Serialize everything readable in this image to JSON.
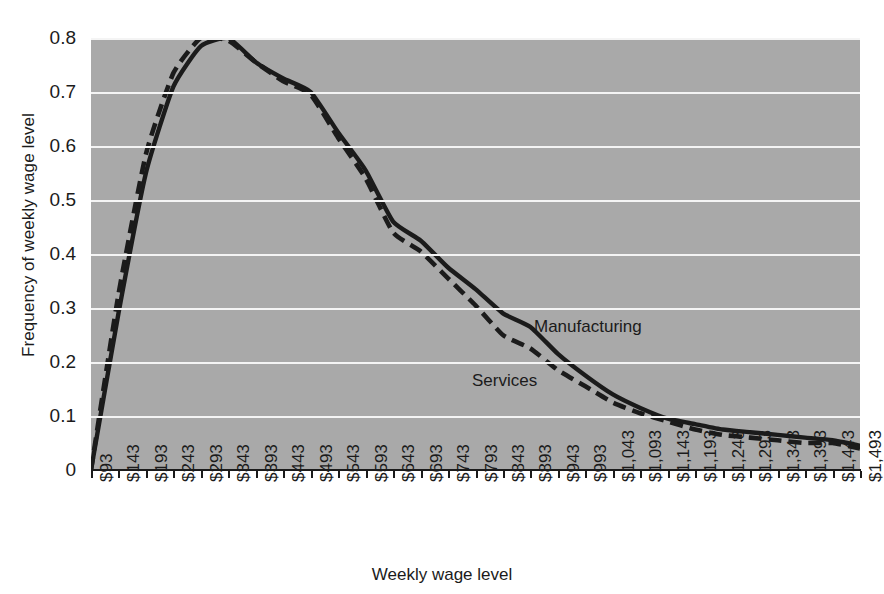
{
  "chart_data": {
    "type": "line",
    "title": "",
    "subtitle": "",
    "xlabel": "Weekly wage level",
    "ylabel": "Frequency of weekly wage level",
    "grid": true,
    "legend_position": "inline-annotations",
    "plot_background_color": "#a9a9a9",
    "gridline_color": "#f4f4f4",
    "line_color": "#1b1b1b",
    "xlim": [
      93,
      1493
    ],
    "ylim": [
      0,
      0.8
    ],
    "y_tick_labels": [
      "0.8",
      "0.7",
      "0.6",
      "0.5",
      "0.4",
      "0.3",
      "0.2",
      "0.1",
      "0"
    ],
    "y_ticks": [
      0.8,
      0.7,
      0.6,
      0.5,
      0.4,
      0.3,
      0.2,
      0.1,
      0
    ],
    "categories": [
      "$93",
      "$143",
      "$193",
      "$243",
      "$293",
      "$343",
      "$393",
      "$443",
      "$493",
      "$543",
      "$593",
      "$643",
      "$693",
      "$743",
      "$793",
      "$843",
      "$893",
      "$943",
      "$993",
      "$1,043",
      "$1,093",
      "$1,143",
      "$1,193",
      "$1,243",
      "$1,293",
      "$1,343",
      "$1,393",
      "$1,443",
      "$1,493"
    ],
    "x": [
      93,
      143,
      193,
      243,
      293,
      343,
      393,
      443,
      493,
      543,
      593,
      643,
      693,
      743,
      793,
      843,
      893,
      943,
      993,
      1043,
      1093,
      1143,
      1193,
      1243,
      1293,
      1343,
      1393,
      1443,
      1493
    ],
    "series": [
      {
        "name": "Manufacturing",
        "style": "solid",
        "values": [
          0.0,
          0.29,
          0.55,
          0.71,
          0.785,
          0.8,
          0.755,
          0.725,
          0.7,
          0.625,
          0.555,
          0.46,
          0.425,
          0.375,
          0.335,
          0.29,
          0.265,
          0.215,
          0.175,
          0.14,
          0.115,
          0.095,
          0.085,
          0.075,
          0.07,
          0.065,
          0.06,
          0.055,
          0.045
        ]
      },
      {
        "name": "Services",
        "style": "dashed",
        "values": [
          0.0,
          0.325,
          0.585,
          0.735,
          0.8,
          0.795,
          0.755,
          0.72,
          0.695,
          0.615,
          0.54,
          0.44,
          0.405,
          0.355,
          0.305,
          0.25,
          0.225,
          0.185,
          0.155,
          0.125,
          0.105,
          0.09,
          0.075,
          0.065,
          0.06,
          0.055,
          0.05,
          0.05,
          0.04
        ]
      }
    ],
    "annotations": [
      {
        "text": "Manufacturing",
        "series": "Manufacturing"
      },
      {
        "text": "Services",
        "series": "Services"
      }
    ]
  }
}
